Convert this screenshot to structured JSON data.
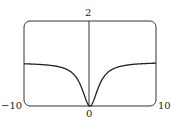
{
  "chart_data": {
    "type": "line",
    "title": "",
    "xlabel": "",
    "ylabel": "",
    "xlim": [
      -10,
      10
    ],
    "ylim": [
      0,
      2
    ],
    "tick_labels": {
      "x_min": "−10",
      "x_max": "10",
      "x_origin": "0",
      "y_max": "2"
    },
    "grid": false,
    "series": [
      {
        "name": "f(x)",
        "x": [
          -10,
          -8,
          -6,
          -4,
          -3,
          -2,
          -1,
          0,
          1,
          2,
          3,
          4,
          6,
          8,
          10
        ],
        "values": [
          1.0,
          0.99,
          0.95,
          0.88,
          0.8,
          0.6,
          0.25,
          0,
          0.25,
          0.6,
          0.8,
          0.88,
          0.95,
          0.99,
          1.02
        ]
      }
    ]
  },
  "labels": {
    "y_top": "2",
    "x_left": "−10",
    "x_right": "10",
    "origin": "0"
  }
}
